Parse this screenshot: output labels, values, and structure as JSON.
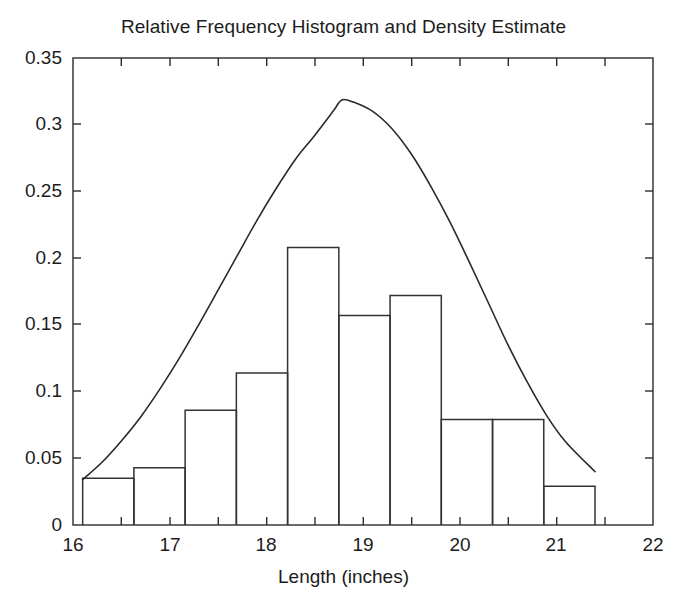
{
  "chart_data": {
    "type": "bar",
    "title": "Relative Frequency Histogram and Density Estimate",
    "xlabel": "Length (inches)",
    "ylabel": "",
    "xlim": [
      16,
      22
    ],
    "ylim": [
      0,
      0.35
    ],
    "grid": false,
    "legend": null,
    "xticks": [
      16,
      17,
      18,
      19,
      20,
      21,
      22
    ],
    "xtick_labels": [
      "16",
      "17",
      "18",
      "19",
      "20",
      "21",
      "22"
    ],
    "xminor_ticks": [
      16.5,
      17.5,
      18.5,
      19.5,
      20.5,
      21.5
    ],
    "yticks": [
      0,
      0.05,
      0.1,
      0.15,
      0.2,
      0.25,
      0.3,
      0.35
    ],
    "ytick_labels": [
      "0",
      "0.05",
      "0.1",
      "0.15",
      "0.2",
      "0.25",
      "0.3",
      "0.35"
    ],
    "bin_edges": [
      16.1,
      16.63,
      17.16,
      17.69,
      18.22,
      18.75,
      19.28,
      19.81,
      20.34,
      20.87,
      21.4
    ],
    "bin_centers": [
      16.365,
      16.895,
      17.425,
      17.955,
      18.485,
      19.015,
      19.545,
      20.075,
      20.605,
      21.135
    ],
    "values": [
      0.035,
      0.043,
      0.086,
      0.114,
      0.208,
      0.157,
      0.172,
      0.079,
      0.079,
      0.029
    ],
    "series": [
      {
        "name": "Relative Frequency Histogram",
        "type": "bar",
        "values": [
          0.035,
          0.043,
          0.086,
          0.114,
          0.208,
          0.157,
          0.172,
          0.079,
          0.079,
          0.029
        ]
      },
      {
        "name": "Density Estimate",
        "type": "line",
        "x": [
          16.1,
          16.3,
          16.5,
          16.7,
          16.9,
          17.1,
          17.3,
          17.5,
          17.7,
          17.9,
          18.1,
          18.3,
          18.5,
          18.7,
          18.78,
          18.9,
          19.1,
          19.3,
          19.5,
          19.7,
          19.9,
          20.1,
          20.3,
          20.5,
          20.7,
          20.9,
          21.1,
          21.4
        ],
        "y": [
          0.034,
          0.047,
          0.063,
          0.081,
          0.102,
          0.125,
          0.15,
          0.176,
          0.202,
          0.228,
          0.252,
          0.274,
          0.292,
          0.311,
          0.3186,
          0.317,
          0.31,
          0.297,
          0.278,
          0.254,
          0.227,
          0.197,
          0.166,
          0.135,
          0.107,
          0.082,
          0.062,
          0.04
        ]
      }
    ]
  },
  "axes": {
    "title": "Relative Frequency Histogram and Density Estimate",
    "x_label": "Length (inches)"
  }
}
